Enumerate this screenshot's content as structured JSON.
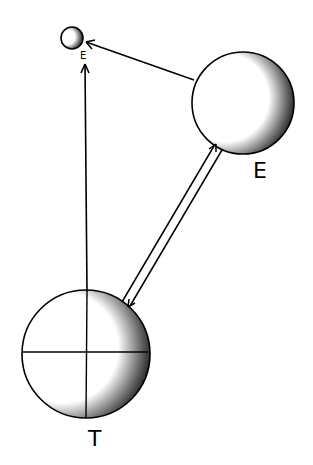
{
  "diagram": {
    "type": "hand-drawn astronomical sketch",
    "nodes": [
      {
        "id": "small",
        "label": "",
        "cx": 72,
        "cy": 38,
        "r": 11,
        "shaded_side": "right"
      },
      {
        "id": "E",
        "label": "E",
        "cx": 243,
        "cy": 103,
        "r": 51,
        "shaded_side": "right"
      },
      {
        "id": "T",
        "label": "T",
        "cx": 86,
        "cy": 354,
        "r": 64,
        "shaded_side": "right",
        "crosshair": true
      }
    ],
    "edges": [
      {
        "from": "E",
        "to": "small",
        "style": "single arrow",
        "arrow_at": "small"
      },
      {
        "from": "T",
        "to": "small",
        "style": "single arrow (vertical)",
        "arrow_at": "small"
      },
      {
        "from": "T",
        "to": "E",
        "style": "double line",
        "arrows_at": [
          "E",
          "T"
        ]
      }
    ],
    "small_mark": "E"
  },
  "labels": {
    "E": "E",
    "T": "T",
    "small_mark": "E"
  },
  "colors": {
    "ink": "#000000",
    "paper": "#ffffff"
  }
}
